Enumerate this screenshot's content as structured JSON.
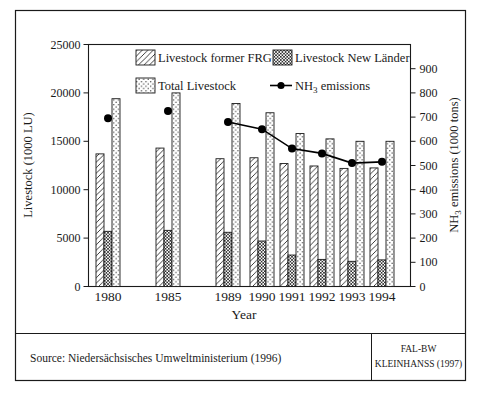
{
  "figure": {
    "source_text": "Source: Niedersächsisches Umweltministerium (1996)",
    "credit_line1": "FAL-BW",
    "credit_line2": "KLEINHANSS (1997)"
  },
  "chart_data": {
    "type": "bar",
    "overlay": "line",
    "title": "",
    "xlabel": "Year",
    "grid": false,
    "legend_position": "top-inside",
    "categories": [
      "1980",
      "1985",
      "1989",
      "1990",
      "1991",
      "1992",
      "1993",
      "1994"
    ],
    "series": [
      {
        "name": "Livestock former FRG",
        "axis": "left",
        "pattern": "diagonal-hatch",
        "values": [
          13700,
          14300,
          13200,
          13300,
          12700,
          12450,
          12200,
          12250
        ]
      },
      {
        "name": "Livestock New Länder",
        "axis": "left",
        "pattern": "checker-hatch",
        "values": [
          5700,
          5800,
          5600,
          4700,
          3250,
          2800,
          2600,
          2750
        ]
      },
      {
        "name": "Total Livestock",
        "axis": "left",
        "pattern": "dot-hatch",
        "values": [
          19400,
          20000,
          18900,
          17950,
          15800,
          15250,
          15000,
          15000
        ]
      }
    ],
    "line_series": {
      "name_prefix": "NH",
      "name_sub": "3",
      "name_suffix": " emissions",
      "axis": "right",
      "color": "#000000",
      "connected_from_index": 2,
      "values": [
        695,
        725,
        680,
        650,
        570,
        550,
        510,
        515
      ]
    },
    "left_axis": {
      "title": "Livestock (1000 LU)",
      "min": 0,
      "max": 25000,
      "ticks": [
        0,
        5000,
        10000,
        15000,
        20000,
        25000
      ]
    },
    "right_axis": {
      "title_prefix": "NH",
      "title_sub": "3",
      "title_suffix": " emissions (1000 tons)",
      "min": 0,
      "max": 1000,
      "ticks": [
        0,
        100,
        200,
        300,
        400,
        500,
        600,
        700,
        800,
        900
      ]
    },
    "legend": [
      {
        "label": "Livestock former FRG",
        "swatch": "diagonal-hatch"
      },
      {
        "label": "Livestock New Länder",
        "swatch": "checker-hatch"
      },
      {
        "label": "Total Livestock",
        "swatch": "dot-hatch"
      },
      {
        "label_prefix": "NH",
        "label_sub": "3",
        "label_suffix": " emissions",
        "swatch": "line-dot"
      }
    ]
  }
}
